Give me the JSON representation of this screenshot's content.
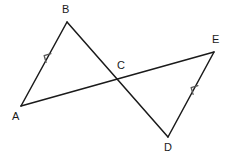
{
  "figure": {
    "type": "geometry-diagram",
    "width": 232,
    "height": 164,
    "background_color": "#ffffff",
    "stroke_color": "#1a1a1a",
    "stroke_width": 1.5,
    "mark_color": "#555555",
    "label_color": "#1a1a1a",
    "label_font_size": 11
  },
  "points": {
    "A": {
      "label": "A",
      "x": 21,
      "y": 106,
      "label_x": 12,
      "label_y": 111
    },
    "B": {
      "label": "B",
      "x": 67,
      "y": 22,
      "label_x": 62,
      "label_y": 4
    },
    "C": {
      "label": "C",
      "x": 117,
      "y": 78,
      "label_x": 117,
      "label_y": 60
    },
    "D": {
      "label": "D",
      "x": 168,
      "y": 137,
      "label_x": 164,
      "label_y": 142
    },
    "E": {
      "label": "E",
      "x": 214,
      "y": 52,
      "label_x": 212,
      "label_y": 34
    }
  },
  "segments": [
    {
      "name": "segment-ab",
      "from": "A",
      "to": "B",
      "x1": 21,
      "y1": 106,
      "x2": 67,
      "y2": 22
    },
    {
      "name": "segment-bd",
      "from": "B",
      "to": "D",
      "x1": 67,
      "y1": 22,
      "x2": 168,
      "y2": 137
    },
    {
      "name": "segment-ae",
      "from": "A",
      "to": "E",
      "x1": 21,
      "y1": 106,
      "x2": 214,
      "y2": 52
    },
    {
      "name": "segment-de",
      "from": "D",
      "to": "E",
      "x1": 168,
      "y1": 137,
      "x2": 214,
      "y2": 52
    }
  ],
  "parallel_marks": [
    {
      "name": "parallel-mark-ab",
      "on_segment": "segment-ab",
      "direction": "up-right",
      "x": 45,
      "y": 56,
      "angle_deg": -61,
      "glyph": "arrowhead"
    },
    {
      "name": "parallel-mark-de",
      "on_segment": "segment-de",
      "direction": "up-right",
      "x": 192,
      "y": 88,
      "angle_deg": -61,
      "glyph": "arrowhead"
    }
  ],
  "chart_data": {
    "type": "scatter",
    "title": "",
    "xlabel": "",
    "ylabel": "",
    "xlim": [
      0,
      232
    ],
    "ylim": [
      0,
      164
    ],
    "grid": false,
    "legend": "none",
    "categories": [
      "A",
      "B",
      "C",
      "D",
      "E"
    ],
    "x": [
      21,
      67,
      117,
      168,
      214
    ],
    "y": [
      106,
      22,
      78,
      137,
      52
    ],
    "annotations": [
      "Segment A-B with single arrow mark",
      "Segment D-E with single arrow mark",
      "Segments A-E and B-D cross at point C"
    ]
  }
}
